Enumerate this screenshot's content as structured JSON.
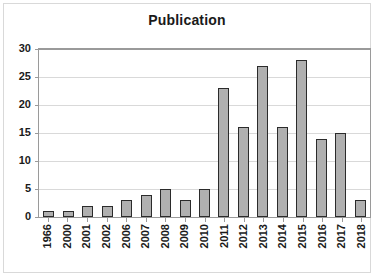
{
  "chart_data": {
    "type": "bar",
    "title": "Publication",
    "xlabel": "",
    "ylabel": "",
    "categories": [
      "1966",
      "2000",
      "2001",
      "2002",
      "2006",
      "2007",
      "2008",
      "2009",
      "2010",
      "2011",
      "2012",
      "2013",
      "2014",
      "2015",
      "2016",
      "2017",
      "2018"
    ],
    "values": [
      1,
      1,
      2,
      2,
      3,
      4,
      5,
      3,
      5,
      23,
      16,
      27,
      16,
      28,
      14,
      15,
      3
    ],
    "ylim": [
      0,
      30
    ],
    "ytick_labels": [
      "0",
      "5",
      "10",
      "15",
      "20",
      "25",
      "30"
    ],
    "ytick_values": [
      0,
      5,
      10,
      15,
      20,
      25,
      30
    ],
    "grid": true,
    "legend": false,
    "legend_position": "none",
    "colors": {
      "bar_fill": "#b0b0b0",
      "bar_border": "#2b2b2b",
      "gridline": "#d9d9d9",
      "axis": "#9a9a9a",
      "text": "#1a1a1a",
      "frame": "#d9d9d9",
      "background": "#ffffff"
    }
  }
}
